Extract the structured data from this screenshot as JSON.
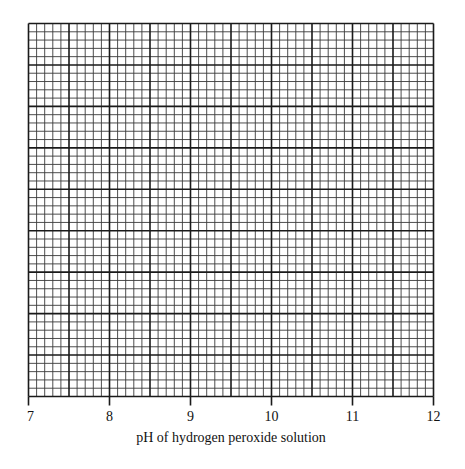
{
  "chart_data": {
    "type": "scatter",
    "title": "",
    "xlabel": "pH of hydrogen peroxide solution",
    "ylabel": "",
    "x_ticks": [
      "7",
      "8",
      "9",
      "10",
      "11",
      "12"
    ],
    "xlim": [
      7,
      12
    ],
    "ylim": null,
    "grid": true,
    "grid_spec": {
      "major_columns": 10,
      "major_rows": 9,
      "minor_per_major": 5
    },
    "series": [],
    "legend": null
  },
  "colors": {
    "grid_major": "#1a1a1a",
    "grid_minor": "#3a3a3a",
    "background": "#ffffff"
  }
}
